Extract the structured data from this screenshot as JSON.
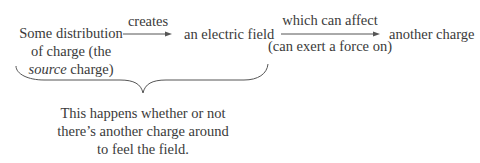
{
  "diagram": {
    "source": {
      "line1": "Some distribution",
      "line2": "of charge (the",
      "line3_italic": "source",
      "line3_rest": " charge)"
    },
    "arrow1_label": "creates",
    "field": "an electric field",
    "arrow2_label_top": "which can affect",
    "arrow2_label_bottom": "(can exert a force on)",
    "target": "another charge",
    "brace_note": {
      "line1": "This happens whether or not",
      "line2": "there’s another charge around",
      "line3": "to feel the field."
    }
  },
  "colors": {
    "text": "#3a3a3a",
    "lines": "#555555"
  }
}
